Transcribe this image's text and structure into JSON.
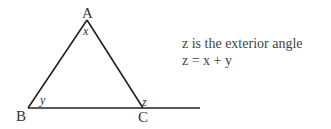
{
  "diagram": {
    "vertices": {
      "A": "A",
      "B": "B",
      "C": "C"
    },
    "angles": {
      "at_A": "x",
      "at_B": "y",
      "exterior_at_C": "z"
    },
    "caption": {
      "line1": "z is the exterior angle",
      "line2": "z = x + y"
    },
    "colors": {
      "stroke": "#222222",
      "text": "#333333"
    }
  }
}
